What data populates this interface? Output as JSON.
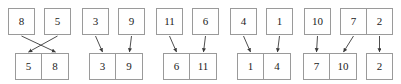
{
  "diagram": {
    "type": "merge-sort-merge-step",
    "colors": {
      "box_border": "#9a9a9a",
      "box_fill": "#ffffff",
      "arrow": "#3a3a3a",
      "text": "#1b1b1b"
    },
    "geometry": {
      "width": 401,
      "height": 84,
      "top_box_size": 27,
      "bottom_box_size": 27,
      "top_row_y": 8,
      "bottom_row_y": 53
    },
    "groups": [
      {
        "id": "group-1",
        "top": [
          {
            "label": "8",
            "x": 8
          },
          {
            "label": "5",
            "x": 44
          }
        ],
        "bottom": [
          {
            "label": "5",
            "x": 15
          },
          {
            "label": "8",
            "x": 42
          }
        ],
        "arrows": [
          {
            "from": 0,
            "to": 1,
            "crossed": true
          },
          {
            "from": 1,
            "to": 0,
            "crossed": true
          }
        ]
      },
      {
        "id": "group-2",
        "top": [
          {
            "label": "3",
            "x": 82
          },
          {
            "label": "9",
            "x": 118
          }
        ],
        "bottom": [
          {
            "label": "3",
            "x": 89
          },
          {
            "label": "9",
            "x": 116
          }
        ],
        "arrows": [
          {
            "from": 0,
            "to": 0,
            "crossed": false
          },
          {
            "from": 1,
            "to": 1,
            "crossed": false
          }
        ]
      },
      {
        "id": "group-3",
        "top": [
          {
            "label": "11",
            "x": 156
          },
          {
            "label": "6",
            "x": 192
          }
        ],
        "bottom": [
          {
            "label": "6",
            "x": 163
          },
          {
            "label": "11",
            "x": 190
          }
        ],
        "arrows": [
          {
            "from": 0,
            "to": 0,
            "crossed": false
          },
          {
            "from": 1,
            "to": 1,
            "crossed": false
          }
        ]
      },
      {
        "id": "group-4",
        "top": [
          {
            "label": "4",
            "x": 230
          },
          {
            "label": "1",
            "x": 266
          }
        ],
        "bottom": [
          {
            "label": "1",
            "x": 237
          },
          {
            "label": "4",
            "x": 264
          }
        ],
        "arrows": [
          {
            "from": 0,
            "to": 0,
            "crossed": false
          },
          {
            "from": 1,
            "to": 1,
            "crossed": false
          }
        ]
      },
      {
        "id": "group-5",
        "top": [
          {
            "label": "10",
            "x": 304
          },
          {
            "label": "7",
            "x": 340
          }
        ],
        "bottom": [
          {
            "label": "7",
            "x": 303
          },
          {
            "label": "10",
            "x": 330
          }
        ],
        "arrows": [
          {
            "from": 0,
            "to": 0,
            "crossed": false
          },
          {
            "from": 1,
            "to": 1,
            "crossed": false
          }
        ]
      },
      {
        "id": "group-6",
        "top": [
          {
            "label": "2",
            "x": 366
          }
        ],
        "bottom": [
          {
            "label": "2",
            "x": 366
          }
        ],
        "arrows": [
          {
            "from": 0,
            "to": 0,
            "crossed": false
          }
        ]
      }
    ]
  }
}
